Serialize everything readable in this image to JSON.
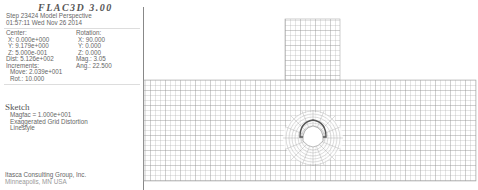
{
  "title": "FLAC3D 3.00",
  "header": {
    "step_line": "Step 23424  Model Perspective",
    "date_line": "01:57:11 Wed Nov 26 2014"
  },
  "view": {
    "center_label": "Center:",
    "rotation_label": "Rotation:",
    "center_x": "X: 0.000e+000",
    "center_y": "Y: 9.179e+000",
    "center_z": "Z: 5.000e-001",
    "rot_x": "X:   90.000",
    "rot_y": "Y:    0.000",
    "rot_z": "Z:    0.000",
    "dist": "Dist: 5.126e+002",
    "mag": "Mag.:     3.05",
    "increments_label": "Increments:",
    "ang": "Ang.:  22.500",
    "move": "Move: 2.039e+001",
    "rot": "Rot.:   10.000"
  },
  "sketch": {
    "heading": "Sketch",
    "magfac": "Magfac = 1.000e+001",
    "mode": "Exaggerated Grid Distortion",
    "style": "Linestyle"
  },
  "footer": {
    "company": "Itasca Consulting Group, Inc.",
    "location": "Minneapolis, MN USA"
  },
  "mesh": {
    "line_color": "#9a9a9a",
    "tunnel_center": [
      313,
      138
    ]
  }
}
